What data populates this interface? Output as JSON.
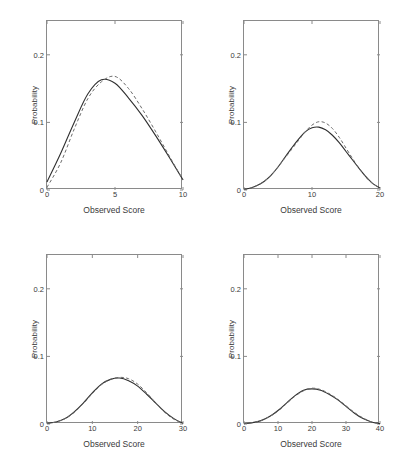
{
  "figure": {
    "background": "#ffffff",
    "frame_color": "#8a8a8a",
    "solid_color": "#2f2f2f",
    "dashed_color": "#6b6b6b"
  },
  "chart_data": [
    {
      "type": "line",
      "panel": "top-left",
      "title": "",
      "xlabel": "Observed Score",
      "ylabel": "Probability",
      "xlim": [
        0,
        10
      ],
      "ylim": [
        0,
        0.25
      ],
      "xticks": [
        0,
        5,
        10
      ],
      "xticklabels": [
        "0",
        "5",
        "10"
      ],
      "yticks": [
        0,
        0.1,
        0.2
      ],
      "yticklabels": [
        "0",
        "0.1",
        "0.2"
      ],
      "grid": false,
      "legend": "none",
      "x": [
        0,
        1,
        2,
        3,
        4,
        5,
        6,
        7,
        8,
        9,
        10
      ],
      "series": [
        {
          "name": "solid",
          "style": "solid",
          "values": [
            0.012,
            0.054,
            0.1,
            0.142,
            0.163,
            0.158,
            0.136,
            0.11,
            0.08,
            0.048,
            0.015
          ]
        },
        {
          "name": "dashed",
          "style": "dashed",
          "values": [
            0.004,
            0.04,
            0.09,
            0.135,
            0.16,
            0.168,
            0.15,
            0.12,
            0.086,
            0.05,
            0.015
          ]
        }
      ]
    },
    {
      "type": "line",
      "panel": "top-right",
      "title": "",
      "xlabel": "Observed Score",
      "ylabel": "Probability",
      "xlim": [
        0,
        20
      ],
      "ylim": [
        0,
        0.25
      ],
      "xticks": [
        0,
        10,
        20
      ],
      "xticklabels": [
        "0",
        "10",
        "20"
      ],
      "yticks": [
        0,
        0.1,
        0.2
      ],
      "yticklabels": [
        "0",
        "0.1",
        "0.2"
      ],
      "grid": false,
      "legend": "none",
      "x": [
        0,
        1,
        2,
        3,
        4,
        5,
        6,
        7,
        8,
        9,
        10,
        11,
        12,
        13,
        14,
        15,
        16,
        17,
        18,
        19,
        20
      ],
      "series": [
        {
          "name": "solid",
          "style": "solid",
          "values": [
            0.001,
            0.003,
            0.007,
            0.013,
            0.022,
            0.034,
            0.048,
            0.062,
            0.075,
            0.086,
            0.092,
            0.093,
            0.089,
            0.081,
            0.07,
            0.057,
            0.044,
            0.031,
            0.019,
            0.009,
            0.003
          ]
        },
        {
          "name": "dashed",
          "style": "dashed",
          "values": [
            0.001,
            0.003,
            0.007,
            0.013,
            0.022,
            0.034,
            0.047,
            0.06,
            0.073,
            0.086,
            0.096,
            0.101,
            0.099,
            0.091,
            0.078,
            0.062,
            0.046,
            0.031,
            0.018,
            0.009,
            0.003
          ]
        }
      ]
    },
    {
      "type": "line",
      "panel": "bottom-left",
      "title": "",
      "xlabel": "Observed Score",
      "ylabel": "Probability",
      "xlim": [
        0,
        30
      ],
      "ylim": [
        0,
        0.25
      ],
      "xticks": [
        0,
        10,
        20,
        30
      ],
      "xticklabels": [
        "0",
        "10",
        "20",
        "30"
      ],
      "yticks": [
        0,
        0.1,
        0.2
      ],
      "yticklabels": [
        "0",
        "0.1",
        "0.2"
      ],
      "grid": false,
      "legend": "none",
      "x": [
        0,
        2,
        4,
        6,
        8,
        10,
        12,
        14,
        16,
        18,
        20,
        22,
        24,
        26,
        28,
        30
      ],
      "series": [
        {
          "name": "solid",
          "style": "solid",
          "values": [
            0.001,
            0.003,
            0.008,
            0.018,
            0.031,
            0.046,
            0.059,
            0.066,
            0.068,
            0.064,
            0.056,
            0.044,
            0.031,
            0.018,
            0.008,
            0.001
          ]
        },
        {
          "name": "dashed",
          "style": "dashed",
          "values": [
            0.001,
            0.003,
            0.008,
            0.017,
            0.03,
            0.045,
            0.058,
            0.066,
            0.069,
            0.067,
            0.059,
            0.046,
            0.031,
            0.017,
            0.007,
            0.001
          ]
        }
      ]
    },
    {
      "type": "line",
      "panel": "bottom-right",
      "title": "",
      "xlabel": "Observed Score",
      "ylabel": "Probability",
      "xlim": [
        0,
        40
      ],
      "ylim": [
        0,
        0.25
      ],
      "xticks": [
        0,
        10,
        20,
        30,
        40
      ],
      "xticklabels": [
        "0",
        "10",
        "20",
        "30",
        "40"
      ],
      "yticks": [
        0,
        0.1,
        0.2
      ],
      "yticklabels": [
        "0",
        "0.1",
        "0.2"
      ],
      "grid": false,
      "legend": "none",
      "x": [
        0,
        2.5,
        5,
        7.5,
        10,
        12.5,
        15,
        17.5,
        20,
        22.5,
        25,
        27.5,
        30,
        32.5,
        35,
        37.5,
        40
      ],
      "series": [
        {
          "name": "solid",
          "style": "solid",
          "values": [
            0.0005,
            0.002,
            0.005,
            0.011,
            0.02,
            0.031,
            0.042,
            0.05,
            0.052,
            0.05,
            0.044,
            0.036,
            0.026,
            0.016,
            0.008,
            0.003,
            0.0005
          ]
        },
        {
          "name": "dashed",
          "style": "dashed",
          "values": [
            0.0005,
            0.002,
            0.005,
            0.011,
            0.019,
            0.03,
            0.041,
            0.049,
            0.053,
            0.051,
            0.045,
            0.037,
            0.027,
            0.017,
            0.009,
            0.003,
            0.0005
          ]
        }
      ]
    }
  ]
}
